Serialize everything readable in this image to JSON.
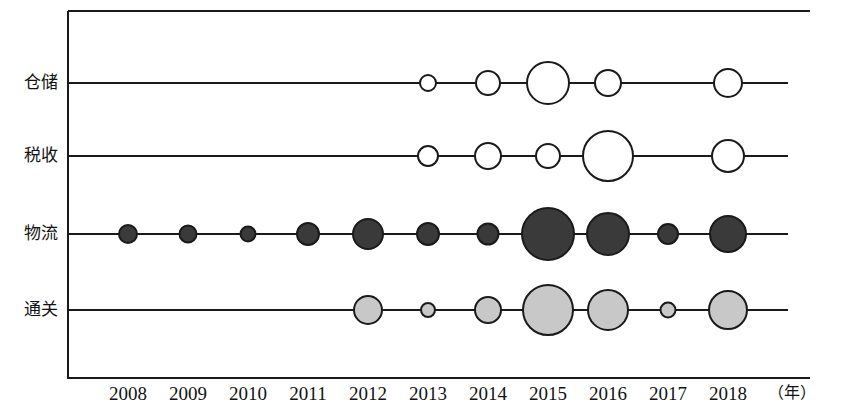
{
  "chart_data": {
    "type": "scatter",
    "title": "",
    "xlabel": "（年）",
    "ylabel": "",
    "categories": [
      "仓储",
      "税收",
      "物流",
      "通关"
    ],
    "x": [
      2008,
      2009,
      2010,
      2011,
      2012,
      2013,
      2014,
      2015,
      2016,
      2017,
      2018
    ],
    "xlim": [
      2007.5,
      2018.7
    ],
    "grid": false,
    "legend": "none",
    "note": "Bubble timeline: bubble radius encodes magnitude per category-year; null means no bubble drawn.",
    "series": [
      {
        "name": "仓储",
        "fill": "#ffffff",
        "stroke": "#1a1a1a",
        "radii": [
          null,
          null,
          null,
          null,
          null,
          8,
          12,
          21,
          13,
          null,
          14
        ]
      },
      {
        "name": "税收",
        "fill": "#ffffff",
        "stroke": "#1a1a1a",
        "radii": [
          null,
          null,
          null,
          null,
          null,
          10,
          13,
          12,
          25,
          null,
          16
        ]
      },
      {
        "name": "物流",
        "fill": "#3a3a3a",
        "stroke": "#1a1a1a",
        "radii": [
          9,
          8.5,
          7.5,
          11,
          15,
          11,
          10.5,
          26,
          21,
          10,
          18
        ]
      },
      {
        "name": "通关",
        "fill": "#c8c8c8",
        "stroke": "#1a1a1a",
        "radii": [
          null,
          null,
          null,
          null,
          14,
          7,
          13,
          25,
          20,
          7.5,
          19
        ]
      }
    ]
  },
  "axis": {
    "unit": "（年）",
    "tick_labels": [
      "2008",
      "2009",
      "2010",
      "2011",
      "2012",
      "2013",
      "2014",
      "2015",
      "2016",
      "2017",
      "2018"
    ],
    "category_labels": [
      "仓储",
      "税收",
      "物流",
      "通关"
    ]
  },
  "colors": {
    "frame": "#1a1a1a",
    "line": "#1a1a1a",
    "warehousing_fill": "#ffffff",
    "tax_fill": "#ffffff",
    "logistics_fill": "#3a3a3a",
    "customs_fill": "#c8c8c8",
    "text": "#121212",
    "background": "#ffffff"
  }
}
